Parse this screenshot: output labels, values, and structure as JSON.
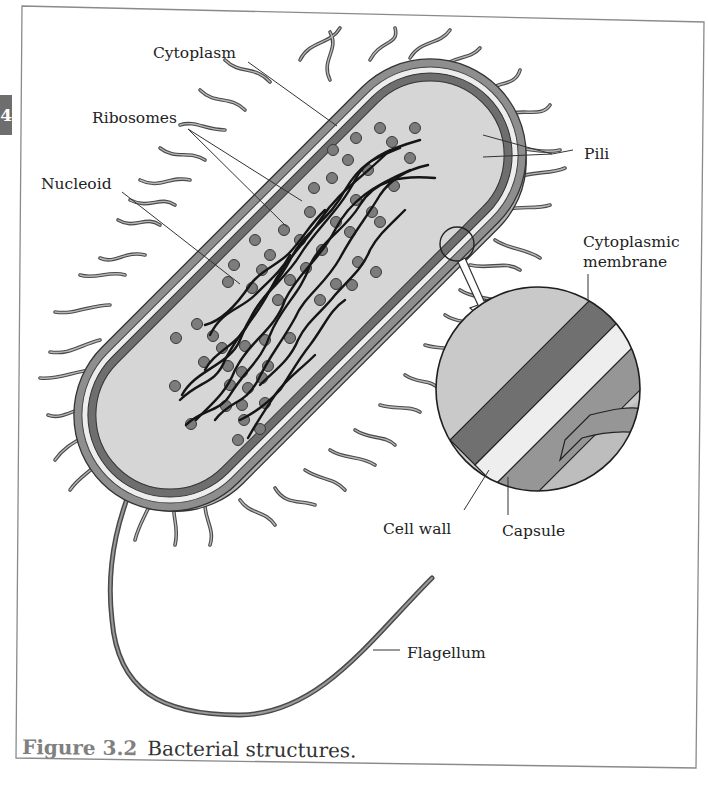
{
  "page_tab": {
    "label": "4"
  },
  "figure": {
    "number": "Figure 3.2",
    "title": "Bacterial structures."
  },
  "labels": {
    "cytoplasm": "Cytoplasm",
    "ribosomes": "Ribosomes",
    "nucleoid": "Nucleoid",
    "pili": "Pili",
    "cytoplasmic_membrane_line1": "Cytoplasmic",
    "cytoplasmic_membrane_line2": "membrane",
    "cell_wall": "Cell wall",
    "capsule": "Capsule",
    "flagellum": "Flagellum"
  },
  "colors": {
    "cytoplasm_fill": "#d4d4d4",
    "membrane": "#707070",
    "cell_wall": "#e8e8e8",
    "capsule": "#9a9a9a",
    "ribosome": "#7a7a7a",
    "dna": "#1a1a1a",
    "frame": "#888888"
  }
}
